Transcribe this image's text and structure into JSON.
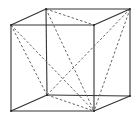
{
  "diagram": {
    "type": "cube-wireframe",
    "colors": {
      "edge": "#333333",
      "diagonal": "#666666",
      "background": "#ffffff"
    },
    "vertices": {
      "front_top_left": [
        11,
        25
      ],
      "front_top_right": [
        94,
        25
      ],
      "front_bottom_left": [
        11,
        111
      ],
      "front_bottom_right": [
        94,
        111
      ],
      "back_top_left": [
        46,
        9
      ],
      "back_top_right": [
        130,
        9
      ],
      "back_bottom_left": [
        47,
        95
      ],
      "back_bottom_right": [
        130,
        96
      ]
    },
    "solid_edges": [
      [
        "front_top_left",
        "front_top_right"
      ],
      [
        "front_top_right",
        "front_bottom_right"
      ],
      [
        "front_bottom_right",
        "front_bottom_left"
      ],
      [
        "front_bottom_left",
        "front_top_left"
      ],
      [
        "back_top_left",
        "back_top_right"
      ],
      [
        "back_top_right",
        "back_bottom_right"
      ],
      [
        "back_bottom_right",
        "back_bottom_left"
      ],
      [
        "back_bottom_left",
        "back_top_left"
      ],
      [
        "front_top_left",
        "back_top_left"
      ],
      [
        "front_top_right",
        "back_top_right"
      ],
      [
        "front_bottom_left",
        "back_bottom_left"
      ],
      [
        "front_bottom_right",
        "back_bottom_right"
      ]
    ],
    "dashed_edges": [
      [
        "front_top_left",
        "front_bottom_right"
      ],
      [
        "front_top_left",
        "back_bottom_left"
      ],
      [
        "back_top_left",
        "front_top_right"
      ],
      [
        "back_top_left",
        "front_bottom_right"
      ],
      [
        "back_top_right",
        "back_bottom_left"
      ],
      [
        "back_top_right",
        "front_bottom_right"
      ],
      [
        "back_bottom_left",
        "front_bottom_right"
      ]
    ]
  }
}
